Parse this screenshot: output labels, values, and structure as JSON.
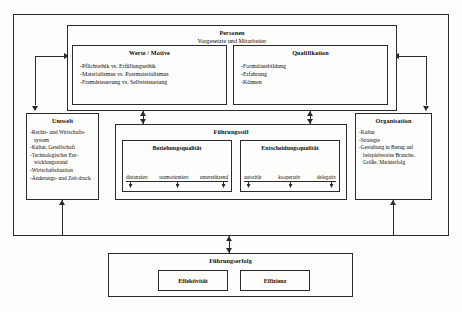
{
  "diagram": {
    "personen": {
      "title": "Personen",
      "subtitle": "Vorgesetzte und Mitarbeiter"
    },
    "werte": {
      "title": "Werte / Motive",
      "items": [
        "-Pflichtethik vs. Erfüllungsethik",
        "-Materialismus vs. Postmaterialismus",
        "-Fremdsteuerung vs. Selbststeuerung"
      ]
    },
    "qualifikation": {
      "title": "Qualifikation",
      "items": [
        "-Formalausbildung",
        "-Erfahrung",
        "-Können"
      ]
    },
    "umwelt": {
      "title": "Umwelt",
      "items": [
        "-Rechts- und Wirtschafts-system",
        "-Kultur, Gesellschaft",
        "-Technologischer Ent-wicklungsstand",
        "-Wirtschaftsituation",
        "-Änderungs- und Zeit-druck"
      ]
    },
    "organisation": {
      "title": "Organisation",
      "items": [
        "-Kultur",
        "-Strategie",
        "-Gestaltung in Bezug auf beispielsweise Branche, Größe, Markterfolg"
      ]
    },
    "fuehrungsstil": {
      "title": "Führungsstil"
    },
    "beziehungsqualitaet": {
      "title": "Beziehungsqualität",
      "scale": [
        "distanziert",
        "teamorientiert",
        "unterstützend"
      ]
    },
    "entscheidungsqualitaet": {
      "title": "Entscheidungsqualität",
      "scale": [
        "autoritär",
        "kooperativ",
        "delegativ"
      ]
    },
    "fuehrungserfolg": {
      "title": "Führungserfolg",
      "effektivitaet": "Effektivität",
      "effizienz": "Effizienz"
    }
  },
  "style": {
    "line_color": "#2a2a2a",
    "background": "#fdfdfc"
  }
}
